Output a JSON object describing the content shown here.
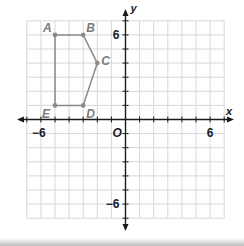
{
  "chart_data": {
    "type": "scatter",
    "title": "",
    "xlabel": "x",
    "ylabel": "y",
    "xlim": [
      -7,
      7
    ],
    "ylim": [
      -7,
      7
    ],
    "grid": true,
    "tick_labels": {
      "x": [
        {
          "value": -6,
          "label": "−6"
        },
        {
          "value": 6,
          "label": "6"
        }
      ],
      "y": [
        {
          "value": 6,
          "label": "6"
        },
        {
          "value": -6,
          "label": "−6"
        }
      ]
    },
    "origin_label": "O",
    "polygon": {
      "name": "ABCDE",
      "closed": true,
      "points": [
        {
          "label": "A",
          "x": -5,
          "y": 6
        },
        {
          "label": "B",
          "x": -3,
          "y": 6
        },
        {
          "label": "C",
          "x": -2,
          "y": 4
        },
        {
          "label": "D",
          "x": -3,
          "y": 1
        },
        {
          "label": "E",
          "x": -5,
          "y": 1
        }
      ]
    }
  },
  "colors": {
    "grid": "#d8d8d8",
    "axis": "#1a1a1a",
    "polygon": "#8a8a8a",
    "vertex_label": "#7a7a7a",
    "tick_label": "#1a1a1a"
  }
}
